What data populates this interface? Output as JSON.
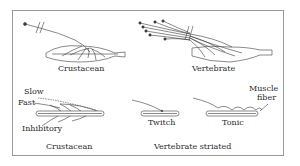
{
  "figure": {
    "top_left": {
      "caption": "Crustacean"
    },
    "top_right": {
      "caption": "Vertebrate"
    },
    "bottom_left": {
      "caption": "Crustacean",
      "axon_labels": [
        "Slow",
        "Fast",
        "Inhibitory"
      ]
    },
    "bottom_right": {
      "caption": "Vertebrate striated",
      "fiber_types": [
        "Twitch",
        "Tonic"
      ],
      "muscle_fiber_label_line1": "Muscle",
      "muscle_fiber_label_line2": "fiber"
    },
    "colors": {
      "line": "#3a3a3a",
      "frame": "#9a9a9a",
      "background": "#ffffff"
    }
  }
}
